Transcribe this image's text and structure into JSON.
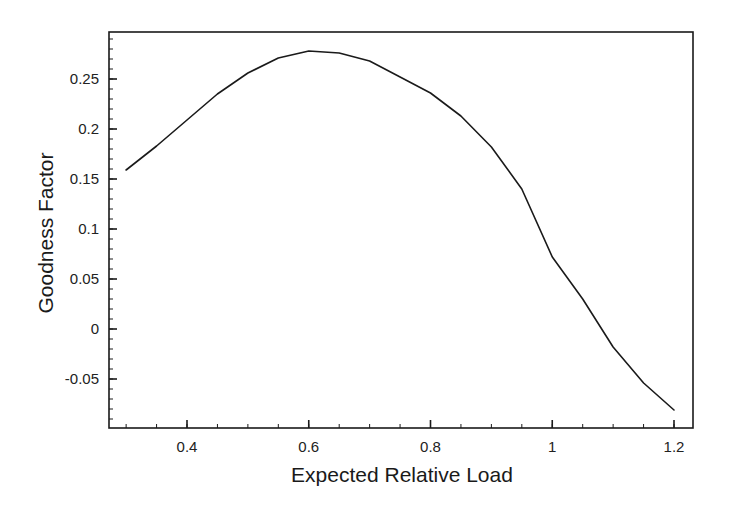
{
  "chart_data": {
    "type": "line",
    "title": "",
    "xlabel": "Expected Relative Load",
    "ylabel": "Goodness Factor",
    "xlim": [
      0.272,
      1.23
    ],
    "ylim": [
      -0.099,
      0.297
    ],
    "grid": false,
    "legend": null,
    "x_ticks": [
      0.4,
      0.6,
      0.8,
      1.0,
      1.2
    ],
    "x_tick_labels": [
      "0.4",
      "0.6",
      "0.8",
      "1",
      "1.2"
    ],
    "x_minor_step": 0.05,
    "y_ticks": [
      -0.05,
      0,
      0.05,
      0.1,
      0.15,
      0.2,
      0.25
    ],
    "y_tick_labels": [
      "-0.05",
      "0",
      "0.05",
      "0.1",
      "0.15",
      "0.2",
      "0.25"
    ],
    "y_minor_step": 0.01,
    "series": [
      {
        "name": "Goodness Factor",
        "color": "#1a1a1a",
        "x": [
          0.3,
          0.35,
          0.4,
          0.45,
          0.5,
          0.55,
          0.6,
          0.65,
          0.7,
          0.75,
          0.8,
          0.85,
          0.9,
          0.95,
          1.0,
          1.05,
          1.1,
          1.15,
          1.2
        ],
        "y": [
          0.159,
          0.183,
          0.209,
          0.235,
          0.256,
          0.271,
          0.278,
          0.276,
          0.268,
          0.252,
          0.236,
          0.213,
          0.182,
          0.14,
          0.072,
          0.03,
          -0.018,
          -0.054,
          -0.081
        ]
      }
    ]
  },
  "layout": {
    "frame": {
      "left": 109,
      "top": 32,
      "right": 693,
      "bottom": 428
    },
    "x_ref": {
      "value": 0.4,
      "px": 187,
      "px_per_unit": 608.75
    },
    "y_ref": {
      "value": 0,
      "px": 329,
      "px_per_unit": 1000
    }
  }
}
